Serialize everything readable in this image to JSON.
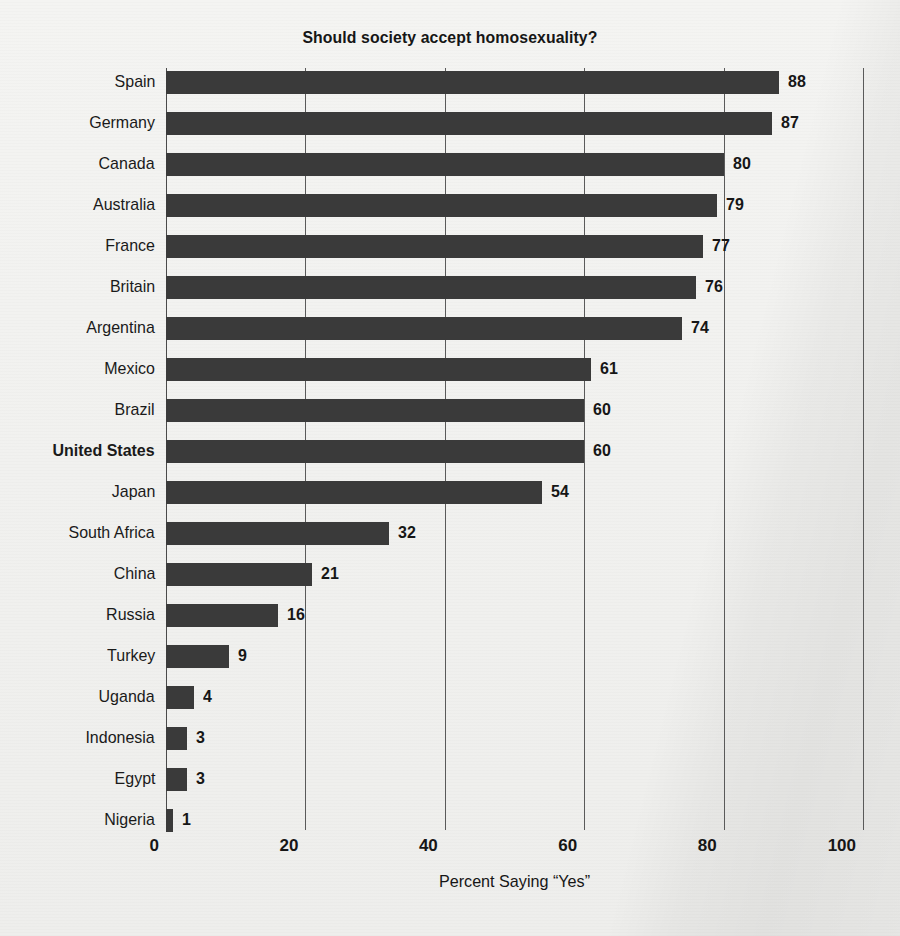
{
  "chart_data": {
    "type": "bar",
    "orientation": "horizontal",
    "title": "Should society accept homosexuality?",
    "xlabel": "Percent Saying “Yes”",
    "ylabel": "",
    "xlim": [
      0,
      100
    ],
    "xticks": [
      0,
      20,
      40,
      60,
      80,
      100
    ],
    "xtick_labels": [
      "0",
      "20",
      "40",
      "60",
      "80",
      "100"
    ],
    "grid": "vertical",
    "legend": "none",
    "bar_color": "#3a3a3a",
    "background_color": "#f2f2f0",
    "highlight_category": "United States",
    "categories": [
      "Spain",
      "Germany",
      "Canada",
      "Australia",
      "France",
      "Britain",
      "Argentina",
      "Mexico",
      "Brazil",
      "United States",
      "Japan",
      "South Africa",
      "China",
      "Russia",
      "Turkey",
      "Uganda",
      "Indonesia",
      "Egypt",
      "Nigeria"
    ],
    "values": [
      88,
      87,
      80,
      79,
      77,
      76,
      74,
      61,
      60,
      60,
      54,
      32,
      21,
      16,
      9,
      4,
      3,
      3,
      1
    ],
    "value_labels": [
      "88",
      "87",
      "80",
      "79",
      "77",
      "76",
      "74",
      "61",
      "60",
      "60",
      "54",
      "32",
      "21",
      "16",
      "9",
      "4",
      "3",
      "3",
      "1"
    ],
    "rows": [
      {
        "label": "Spain",
        "value": 88,
        "value_label": "88",
        "highlight": false
      },
      {
        "label": "Germany",
        "value": 87,
        "value_label": "87",
        "highlight": false
      },
      {
        "label": "Canada",
        "value": 80,
        "value_label": "80",
        "highlight": false
      },
      {
        "label": "Australia",
        "value": 79,
        "value_label": "79",
        "highlight": false
      },
      {
        "label": "France",
        "value": 77,
        "value_label": "77",
        "highlight": false
      },
      {
        "label": "Britain",
        "value": 76,
        "value_label": "76",
        "highlight": false
      },
      {
        "label": "Argentina",
        "value": 74,
        "value_label": "74",
        "highlight": false
      },
      {
        "label": "Mexico",
        "value": 61,
        "value_label": "61",
        "highlight": false
      },
      {
        "label": "Brazil",
        "value": 60,
        "value_label": "60",
        "highlight": false
      },
      {
        "label": "United States",
        "value": 60,
        "value_label": "60",
        "highlight": true
      },
      {
        "label": "Japan",
        "value": 54,
        "value_label": "54",
        "highlight": false
      },
      {
        "label": "South Africa",
        "value": 32,
        "value_label": "32",
        "highlight": false
      },
      {
        "label": "China",
        "value": 21,
        "value_label": "21",
        "highlight": false
      },
      {
        "label": "Russia",
        "value": 16,
        "value_label": "16",
        "highlight": false
      },
      {
        "label": "Turkey",
        "value": 9,
        "value_label": "9",
        "highlight": false
      },
      {
        "label": "Uganda",
        "value": 4,
        "value_label": "4",
        "highlight": false
      },
      {
        "label": "Indonesia",
        "value": 3,
        "value_label": "3",
        "highlight": false
      },
      {
        "label": "Egypt",
        "value": 3,
        "value_label": "3",
        "highlight": false
      },
      {
        "label": "Nigeria",
        "value": 1,
        "value_label": "1",
        "highlight": false
      }
    ]
  }
}
